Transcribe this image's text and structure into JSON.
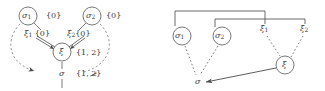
{
  "figure": {
    "stroke_color": "#4a4a4a",
    "text_color": "#3a3a3a",
    "background": "#ffffff"
  },
  "left_panel": {
    "name": "left-diagram",
    "nodes": [
      {
        "id": "sigma1",
        "label": "σ",
        "subscript": "1",
        "circled": true,
        "cx": 28,
        "cy": 16,
        "r": 9
      },
      {
        "id": "sigma2",
        "label": "σ",
        "subscript": "2",
        "circled": true,
        "cx": 92,
        "cy": 16,
        "r": 9
      },
      {
        "id": "xi",
        "label": "ξ",
        "subscript": "",
        "circled": true,
        "cx": 62,
        "cy": 52,
        "r": 9
      },
      {
        "id": "sigma",
        "label": "σ",
        "subscript": "",
        "circled": false,
        "cx": 62,
        "cy": 74,
        "r": 0
      }
    ],
    "set_labels": [
      {
        "for": "sigma1",
        "text": "{0}",
        "x": 46,
        "y": 12
      },
      {
        "for": "sigma2",
        "text": "{0}",
        "x": 106,
        "y": 12
      },
      {
        "for": "xi",
        "text": "{1, 2}",
        "x": 76,
        "y": 49
      },
      {
        "for": "sigma",
        "text": "{1, 2}",
        "x": 76,
        "y": 70,
        "struck_last": true
      }
    ],
    "edge_labels": [
      {
        "id": "xi1",
        "label": "ξ",
        "subscript": "1",
        "set": "{0}",
        "x": 24,
        "y": 31
      },
      {
        "id": "xi2",
        "label": "ξ",
        "subscript": "2",
        "set": "{0}",
        "x": 67,
        "y": 31
      }
    ]
  },
  "right_panel": {
    "name": "right-diagram",
    "nodes": [
      {
        "id": "sigma1",
        "label": "σ",
        "subscript": "1",
        "circled": true,
        "cx": 19,
        "cy": 36,
        "r": 9
      },
      {
        "id": "sigma2",
        "label": "σ",
        "subscript": "2",
        "circled": true,
        "cx": 59,
        "cy": 36,
        "r": 9
      },
      {
        "id": "xi1",
        "label": "ξ",
        "subscript": "1",
        "circled": false,
        "cx": 102,
        "cy": 30,
        "r": 0
      },
      {
        "id": "xi2",
        "label": "ξ",
        "subscript": "2",
        "circled": false,
        "cx": 142,
        "cy": 30,
        "r": 0
      },
      {
        "id": "xi",
        "label": "ξ",
        "subscript": "",
        "circled": true,
        "cx": 122,
        "cy": 65,
        "r": 9
      },
      {
        "id": "sigma",
        "label": "σ",
        "subscript": "",
        "circled": false,
        "cx": 35,
        "cy": 82,
        "r": 0
      }
    ],
    "brackets": [
      {
        "id": "bracket-outer",
        "from": "sigma1",
        "to": "xi1",
        "x1": 12,
        "x2": 102,
        "y": 11
      },
      {
        "id": "bracket-inner",
        "from": "sigma2",
        "to": "xi1",
        "x1": 52,
        "x2": 102,
        "y": 19
      },
      {
        "id": "bracket-right",
        "from": "xi1",
        "to": "xi2",
        "x1": 102,
        "x2": 142,
        "y": 19
      }
    ]
  }
}
